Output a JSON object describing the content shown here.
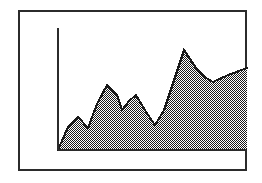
{
  "figure": {
    "background_color": "#ffffff",
    "frame": {
      "name": "outer-frame",
      "x": 19,
      "y": 11,
      "width": 227,
      "height": 159,
      "stroke_color": "#2b2b2b",
      "stroke_width": 2
    }
  },
  "chart_data": {
    "type": "area",
    "title": "",
    "subtitle": "",
    "xlabel": "",
    "ylabel": "",
    "grid": false,
    "legend": null,
    "legend_position": "none",
    "tick_labels_x": [],
    "tick_labels_y": [],
    "annotations": [],
    "axis": {
      "y_axis_x": 58,
      "y_axis_top": 28,
      "y_axis_bottom": 150,
      "baseline_y": 150,
      "baseline_x_start": 58,
      "baseline_x_end": 247,
      "axis_color": "#2b2b2b",
      "axis_width": 2
    },
    "xlim": [
      0,
      18
    ],
    "ylim": [
      0,
      100
    ],
    "x": [
      0,
      1,
      2,
      3,
      4,
      5,
      6,
      7,
      8,
      9,
      10,
      11,
      12,
      13,
      14,
      15,
      16,
      17,
      18
    ],
    "series": [
      {
        "name": "series-1",
        "line_color": "#1a1a1a",
        "line_width": 2,
        "fill_pattern": "checkerboard-50",
        "fill_color": "#000000",
        "fill_background": "#ffffff",
        "values": [
          0,
          19,
          27,
          18,
          38,
          53,
          45,
          33,
          49,
          40,
          21,
          41,
          82,
          69,
          57,
          56,
          61,
          64,
          67
        ]
      }
    ],
    "points_px": [
      [
        58,
        150
      ],
      [
        68,
        127
      ],
      [
        78,
        117
      ],
      [
        88,
        128
      ],
      [
        97,
        104
      ],
      [
        107,
        85
      ],
      [
        117,
        95
      ],
      [
        122,
        110
      ],
      [
        129,
        101
      ],
      [
        136,
        95
      ],
      [
        146,
        112
      ],
      [
        155,
        125
      ],
      [
        164,
        110
      ],
      [
        184,
        50
      ],
      [
        196,
        68
      ],
      [
        206,
        78
      ],
      [
        213,
        82
      ],
      [
        228,
        75
      ],
      [
        247,
        68
      ]
    ]
  }
}
